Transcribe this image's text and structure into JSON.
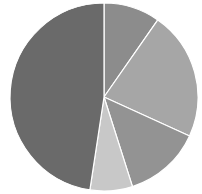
{
  "chart_data": {
    "type": "pie",
    "title": "",
    "legend": [],
    "labels": [
      "Slice 1",
      "Slice 2",
      "Slice 3",
      "Slice 4",
      "Slice 5"
    ],
    "values": [
      9.7,
      22.1,
      13.3,
      7.3,
      47.6
    ],
    "colors": [
      "#8c8c8c",
      "#a6a6a6",
      "#939393",
      "#c8c8c8",
      "#6a6a6a"
    ],
    "start_angle_deg": 0,
    "direction": "clockwise",
    "center": [
      104,
      97
    ],
    "radius": 94
  }
}
